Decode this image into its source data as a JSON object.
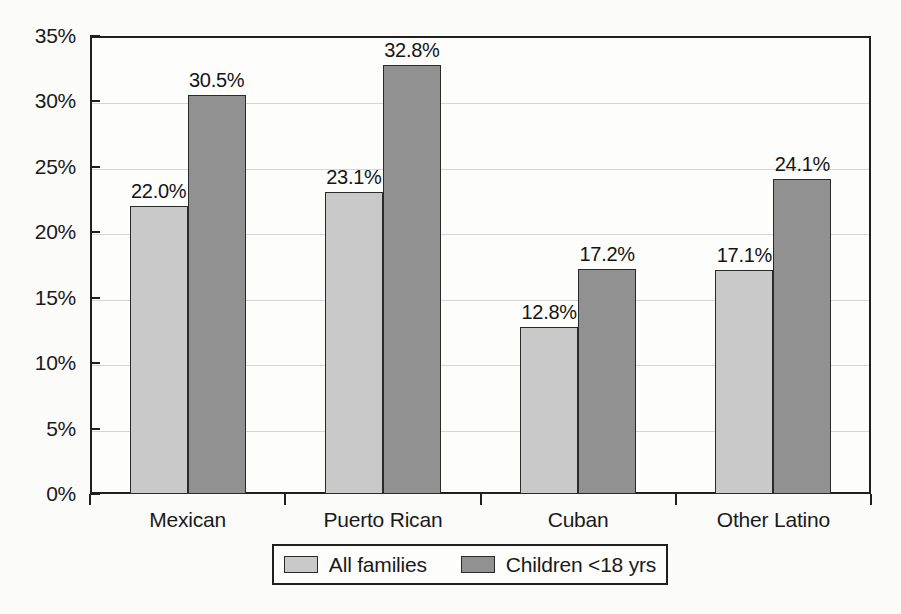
{
  "chart_data": {
    "type": "bar",
    "title": "",
    "subtitle": "",
    "xlabel": "",
    "ylabel": "",
    "ylim": [
      0,
      35
    ],
    "ytick_labels": [
      "0%",
      "5%",
      "10%",
      "15%",
      "20%",
      "25%",
      "30%",
      "35%"
    ],
    "ytick_values": [
      0,
      5,
      10,
      15,
      20,
      25,
      30,
      35
    ],
    "grid": true,
    "legend_position": "bottom",
    "value_label_suffix": "%",
    "categories": [
      "Mexican",
      "Puerto Rican",
      "Cuban",
      "Other Latino"
    ],
    "series": [
      {
        "name": "All families",
        "color": "#c9c9c9",
        "values": [
          22.0,
          23.1,
          12.8,
          17.1
        ],
        "labels": [
          "22.0%",
          "23.1%",
          "12.8%",
          "17.1%"
        ]
      },
      {
        "name": "Children <18 yrs",
        "color": "#919191",
        "values": [
          30.5,
          32.8,
          17.2,
          24.1
        ],
        "labels": [
          "30.5%",
          "32.8%",
          "17.2%",
          "24.1%"
        ]
      }
    ]
  },
  "legend": {
    "items": [
      {
        "label": "All families",
        "swatch": "#c9c9c9"
      },
      {
        "label": "Children <18 yrs",
        "swatch": "#919191"
      }
    ]
  },
  "colors": {
    "series_all_families": "#c9c9c9",
    "series_children": "#919191",
    "axis": "#1f1f1f",
    "gridline": "#d6d6d6",
    "background": "#fbfbfa"
  }
}
